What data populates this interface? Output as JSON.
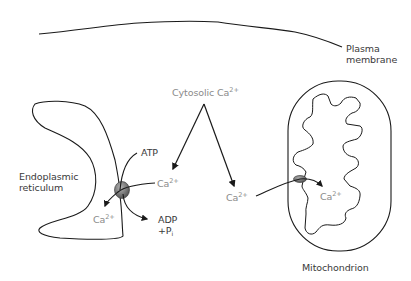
{
  "diagram": {
    "colors": {
      "line": "#1a1a1a",
      "label_dark": "#3a3a3a",
      "label_ion": "#8a8a8a",
      "pump_fill": "#7a7a7a"
    },
    "labels": {
      "plasma_membrane_1": "Plasma",
      "plasma_membrane_2": "membrane",
      "cytosolic": "Cytosolic Ca",
      "cytosolic_charge": "2+",
      "er_1": "Endoplasmic",
      "er_2": "reticulum",
      "atp": "ATP",
      "ca_er_in": "Ca",
      "ca_er_in_charge": "2+",
      "ca_er_lumen": "Ca",
      "ca_er_lumen_charge": "2+",
      "adp": "ADP",
      "pi": "+P",
      "pi_sub": "i",
      "ca_mito_out": "Ca",
      "ca_mito_out_charge": "2+",
      "ca_mito_in": "Ca",
      "ca_mito_in_charge": "2+",
      "mitochondrion": "Mitochondrion"
    },
    "nodes": [
      {
        "id": "plasma-membrane",
        "label": "Plasma membrane"
      },
      {
        "id": "cytosolic-ca",
        "label": "Cytosolic Ca2+"
      },
      {
        "id": "er",
        "label": "Endoplasmic reticulum"
      },
      {
        "id": "er-ca-pump",
        "label": "Ca2+ ATPase pump"
      },
      {
        "id": "mitochondrion",
        "label": "Mitochondrion"
      },
      {
        "id": "mito-uniporter",
        "label": "Mitochondrial Ca2+ channel"
      }
    ],
    "edges": [
      {
        "from": "cytosolic-ca",
        "to": "er-ca-pump",
        "label": "Ca2+"
      },
      {
        "from": "cytosolic-ca",
        "to": "mito-uniporter",
        "label": "Ca2+"
      },
      {
        "from": "er-ca-pump",
        "to": "er",
        "label": "Ca2+"
      },
      {
        "from": "ATP",
        "to": "ADP + Pi",
        "via": "er-ca-pump"
      },
      {
        "from": "mito-uniporter",
        "to": "mitochondrion",
        "label": "Ca2+"
      }
    ]
  }
}
